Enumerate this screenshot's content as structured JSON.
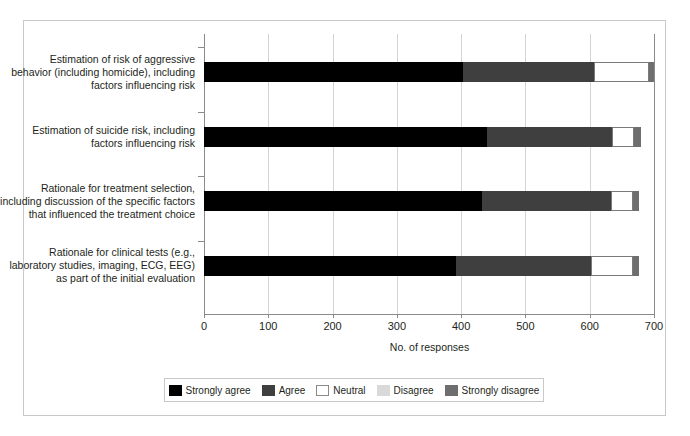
{
  "chart_data": {
    "type": "bar",
    "orientation": "horizontal",
    "stacked": true,
    "title": "",
    "xlabel": "No. of responses",
    "ylabel": "",
    "xlim": [
      0,
      700
    ],
    "xticks": [
      0,
      100,
      200,
      300,
      400,
      500,
      600,
      700
    ],
    "grid": "vertical",
    "legend_position": "bottom",
    "categories": [
      "Estimation of risk of aggressive behavior (including homicide), including factors influencing risk",
      "Estimation of suicide risk, including factors influencing risk",
      "Rationale for treatment selection, including discussion of the specific factors that influenced the treatment choice",
      "Rationale for clinical tests (e.g., laboratory studies, imaging, ECG, EEG) as part of the initial evaluation"
    ],
    "category_lines": [
      [
        "Estimation of risk of aggressive",
        "behavior (including homicide), including",
        "factors influencing risk"
      ],
      [
        "Estimation of suicide risk, including",
        "factors influencing risk"
      ],
      [
        "Rationale for treatment selection,",
        "including discussion of the specific factors",
        "that influenced the treatment choice"
      ],
      [
        "Rationale for clinical tests (e.g.,",
        "laboratory studies, imaging, ECG, EEG)",
        "as part of the initial evaluation"
      ]
    ],
    "series": [
      {
        "name": "Strongly agree",
        "color": "#000000",
        "values": [
          403,
          440,
          433,
          392
        ]
      },
      {
        "name": "Agree",
        "color": "#3f3f3f",
        "values": [
          204,
          195,
          200,
          210
        ]
      },
      {
        "name": "Neutral",
        "color": "#ffffff",
        "values": [
          85,
          34,
          34,
          65
        ]
      },
      {
        "name": "Disagree",
        "color": "#d9d9d9",
        "values": [
          0,
          0,
          0,
          0
        ]
      },
      {
        "name": "Strongly disagree",
        "color": "#6e6e6e",
        "values": [
          8,
          11,
          10,
          10
        ]
      }
    ]
  },
  "axis": {
    "x_title": "No. of responses",
    "tick_labels": [
      "0",
      "100",
      "200",
      "300",
      "400",
      "500",
      "600",
      "700"
    ]
  },
  "legend": {
    "items": [
      {
        "label": "Strongly agree",
        "key": "strongly-agree"
      },
      {
        "label": "Agree",
        "key": "agree"
      },
      {
        "label": "Neutral",
        "key": "neutral"
      },
      {
        "label": "Disagree",
        "key": "disagree"
      },
      {
        "label": "Strongly disagree",
        "key": "strongly-disagree"
      }
    ]
  }
}
